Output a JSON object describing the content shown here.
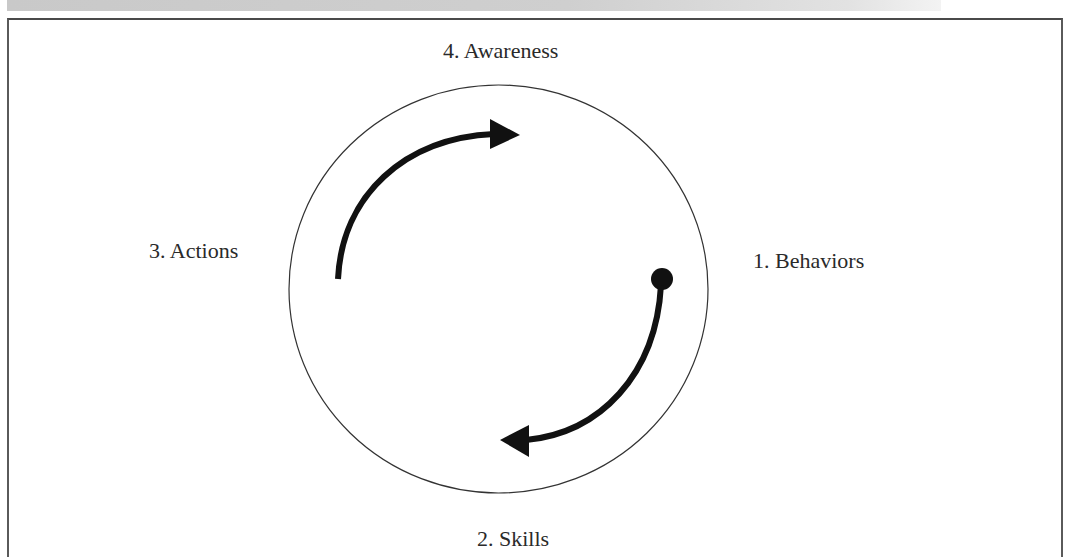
{
  "header": {
    "title": ""
  },
  "diagram": {
    "type": "cycle",
    "stages": [
      {
        "id": "behaviors",
        "label": "1. Behaviors",
        "position": "right"
      },
      {
        "id": "skills",
        "label": "2. Skills",
        "position": "bottom"
      },
      {
        "id": "actions",
        "label": "3. Actions",
        "position": "left"
      },
      {
        "id": "awareness",
        "label": "4. Awareness",
        "position": "top"
      }
    ],
    "labels": {
      "awareness": "4. Awareness",
      "actions": "3. Actions",
      "behaviors": "1. Behaviors",
      "skills": "2. Skills"
    },
    "arrows": [
      {
        "from": "actions",
        "to": "awareness",
        "direction": "clockwise",
        "start_marker": "none",
        "end_marker": "triangle"
      },
      {
        "from": "behaviors",
        "to": "skills",
        "direction": "clockwise",
        "start_marker": "dot",
        "end_marker": "triangle"
      }
    ],
    "colors": {
      "stroke": "#111111",
      "circle": "#333333",
      "text": "#2a2a2a",
      "header_bar": "#cccccc",
      "frame": "#555555"
    }
  }
}
